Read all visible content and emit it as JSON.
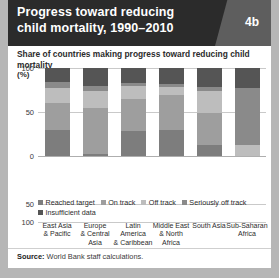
{
  "figure": {
    "badge": "4b",
    "title": "Progress toward reducing child mortality, 1990–2010",
    "title_line1": "Progress toward reducing",
    "title_line2": "child mortality, 1990–2010",
    "subtitle": "Share of countries making progress toward reducing child mortality",
    "unit": "(%)",
    "source_label": "Source:",
    "source_text": "World Bank staff calculations."
  },
  "colors": {
    "reached_target": "#7d7d7d",
    "on_track": "#9e9e9e",
    "off_track": "#bdbdbd",
    "seriously_off_track": "#8a8a8a",
    "insufficient_data": "#555555",
    "header_bg": "#2b2b2b",
    "header_corner": "#5e5e5e",
    "page_bg": "#b6b6b6",
    "panel_bg": "#ffffff",
    "grid": "#c9c9c9"
  },
  "chart_data": {
    "type": "bar",
    "stacked": true,
    "title": "Progress toward reducing child mortality, 1990–2010",
    "subtitle": "Share of countries making progress toward reducing child mortality",
    "xlabel": "",
    "ylabel": "(%)",
    "ylim": [
      0,
      100
    ],
    "yticks": [
      100,
      50,
      0
    ],
    "ytick_labels": [
      "100",
      "50",
      "0"
    ],
    "extra_axis_labels": [
      "50",
      "100"
    ],
    "grid": true,
    "legend_position": "below-plot",
    "categories": [
      "East Asia & Pacific",
      "Europe & Central Asia",
      "Latin America & Caribbean",
      "Middle East & North Africa",
      "South Asia",
      "Sub-Saharan Africa"
    ],
    "series": [
      {
        "name": "Reached target",
        "color": "#7d7d7d",
        "values": [
          30,
          2,
          28,
          30,
          12,
          0
        ]
      },
      {
        "name": "On track",
        "color": "#9e9e9e",
        "values": [
          30,
          52,
          37,
          39,
          37,
          0
        ]
      },
      {
        "name": "Off track",
        "color": "#bdbdbd",
        "values": [
          17,
          20,
          14,
          9,
          25,
          13
        ]
      },
      {
        "name": "Seriously off track",
        "color": "#8a8a8a",
        "values": [
          7,
          6,
          4,
          4,
          4,
          64
        ]
      },
      {
        "name": "Insufficient data",
        "color": "#555555",
        "values": [
          16,
          20,
          17,
          18,
          22,
          23
        ]
      }
    ]
  },
  "legend": {
    "items": [
      {
        "label": "Reached target",
        "color": "#7d7d7d"
      },
      {
        "label": "On track",
        "color": "#9e9e9e"
      },
      {
        "label": "Off track",
        "color": "#bdbdbd"
      },
      {
        "label": "Seriously off track",
        "color": "#8a8a8a"
      },
      {
        "label": "Insufficient data",
        "color": "#555555"
      }
    ]
  },
  "axis": {
    "ticks_upper": [
      "100",
      "50",
      "0"
    ],
    "ticks_lower": [
      "50",
      "100"
    ]
  }
}
